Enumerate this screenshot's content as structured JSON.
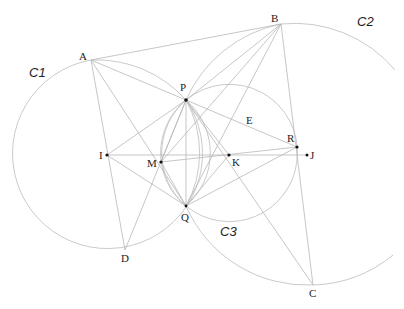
{
  "diagram": {
    "type": "geometry-construction",
    "circle_labels": {
      "c1": "C1",
      "c2": "C2",
      "c3": "C3"
    },
    "point_labels": {
      "A": "A",
      "B": "B",
      "C": "C",
      "D": "D",
      "E": "E",
      "P": "P",
      "Q": "Q",
      "I": "I",
      "J": "J",
      "K": "K",
      "M": "M",
      "R": "R"
    },
    "colors": {
      "lines": "#b8b8b8",
      "circles": "#c4c4c4",
      "points": "#111111",
      "labels": "#222222"
    }
  }
}
